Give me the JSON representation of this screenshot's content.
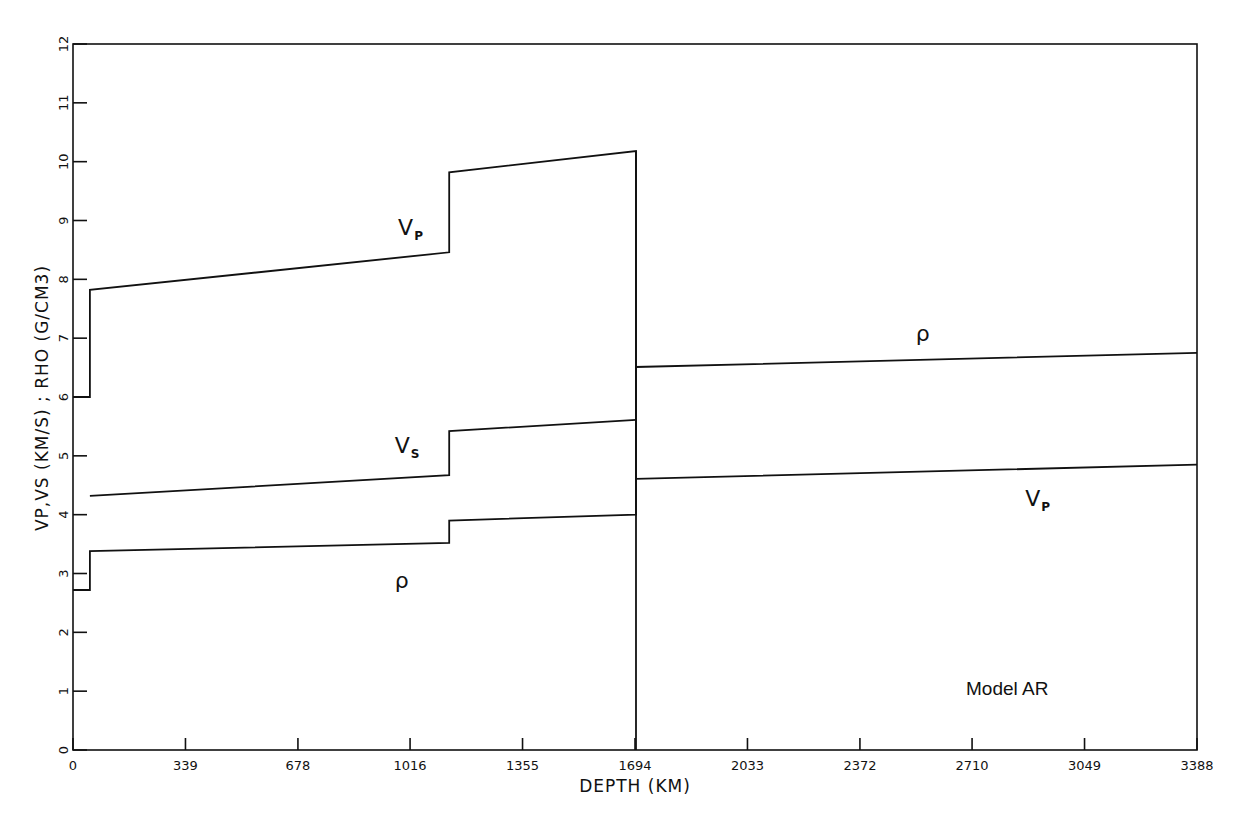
{
  "chart_data": {
    "type": "line",
    "title": "",
    "annotation": "Model AR",
    "xlabel": "DEPTH (KM)",
    "ylabel": "VP,VS (KM/S) ; RHO (G/CM3)",
    "xlim": [
      0,
      3388
    ],
    "ylim": [
      0,
      12
    ],
    "x_ticks": [
      0,
      339,
      678,
      1016,
      1355,
      1694,
      2033,
      2372,
      2710,
      3049,
      3388
    ],
    "x_tick_labels": [
      "0",
      "339",
      "678",
      "1016",
      "1355",
      "1694",
      "2033",
      "2372",
      "2710",
      "3049",
      "3388"
    ],
    "y_ticks": [
      0,
      1,
      2,
      3,
      4,
      5,
      6,
      7,
      8,
      9,
      10,
      11,
      12
    ],
    "y_tick_labels": [
      "0",
      "1",
      "2",
      "3",
      "4",
      "5",
      "6",
      "7",
      "8",
      "9",
      "10",
      "11",
      "12"
    ],
    "grid": false,
    "legend": "none (inline curve labels)",
    "series": [
      {
        "name": "Vp",
        "label_main": "V",
        "label_sub": "P",
        "x": [
          0,
          51,
          51,
          1134,
          1134,
          1697,
          1697,
          3388
        ],
        "y": [
          6.0,
          6.0,
          7.82,
          8.46,
          9.82,
          10.18,
          4.61,
          4.85
        ]
      },
      {
        "name": "Vs",
        "label_main": "V",
        "label_sub": "S",
        "x": [
          51,
          1134,
          1134,
          1697
        ],
        "y": [
          4.32,
          4.67,
          5.42,
          5.61
        ]
      },
      {
        "name": "rho",
        "label_main": "ρ",
        "label_sub": "",
        "x": [
          0,
          51,
          51,
          1134,
          1134,
          1697,
          1697,
          3388
        ],
        "y": [
          2.72,
          2.72,
          3.38,
          3.52,
          3.9,
          4.0,
          6.51,
          6.75
        ]
      }
    ],
    "inline_labels": [
      {
        "text": "V",
        "sub": "P",
        "x": 980,
        "y": 8.75
      },
      {
        "text": "V",
        "sub": "S",
        "x": 970,
        "y": 5.05
      },
      {
        "text": "ρ",
        "sub": "",
        "x": 970,
        "y": 2.75
      },
      {
        "text": "ρ",
        "sub": "",
        "x": 2540,
        "y": 6.95
      },
      {
        "text": "V",
        "sub": "P",
        "x": 2870,
        "y": 4.15
      }
    ],
    "vertical_drop": {
      "x": 1697,
      "from": 10.18,
      "to": 0
    }
  }
}
